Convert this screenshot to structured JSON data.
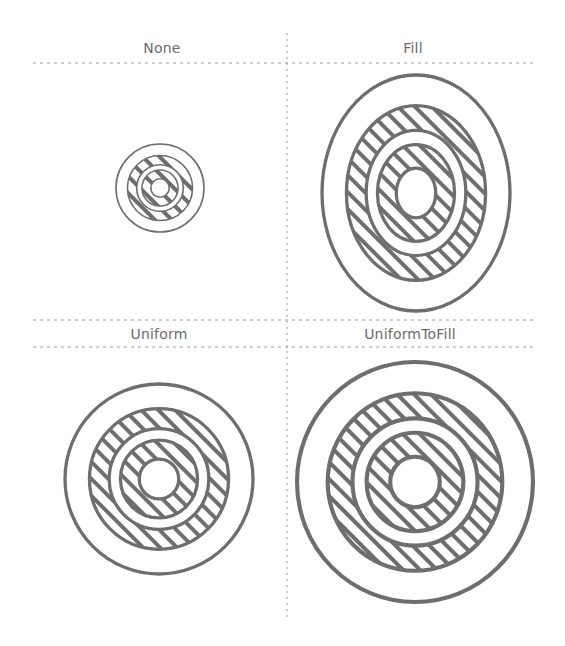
{
  "diagram": {
    "title_none": "None",
    "title_fill": "Fill",
    "title_uniform": "Uniform",
    "title_uniform_to_fill": "UniformToFill",
    "colors": {
      "stroke": "#6e6e6e",
      "guide": "#9a9a9a",
      "text": "#6b6b6b",
      "background": "#ffffff"
    },
    "guides": {
      "vertical": {
        "x": 287,
        "y1": 33,
        "y2": 618
      },
      "horizontal": [
        {
          "y": 63,
          "x1": 33,
          "x2": 535
        },
        {
          "y": 320,
          "x1": 33,
          "x2": 535
        },
        {
          "y": 347,
          "x1": 33,
          "x2": 535
        }
      ]
    },
    "panels": [
      {
        "name": "none",
        "label_x": 162,
        "label_y": 40,
        "cx": 160,
        "cy": 188,
        "rx": 44,
        "ry": 44
      },
      {
        "name": "fill",
        "label_x": 413,
        "label_y": 40,
        "cx": 416,
        "cy": 193,
        "rx": 94,
        "ry": 118
      },
      {
        "name": "uniform",
        "label_x": 159,
        "label_y": 326,
        "cx": 159,
        "cy": 479,
        "rx": 94,
        "ry": 95
      },
      {
        "name": "uniform-to-fill",
        "label_x": 410,
        "label_y": 326,
        "cx": 415,
        "cy": 482,
        "rx": 118,
        "ry": 120
      }
    ],
    "ring_ratios": {
      "band1_outer": 0.74,
      "band1_inner": 0.53,
      "band2_outer": 0.41,
      "band2_inner": 0.21
    }
  }
}
